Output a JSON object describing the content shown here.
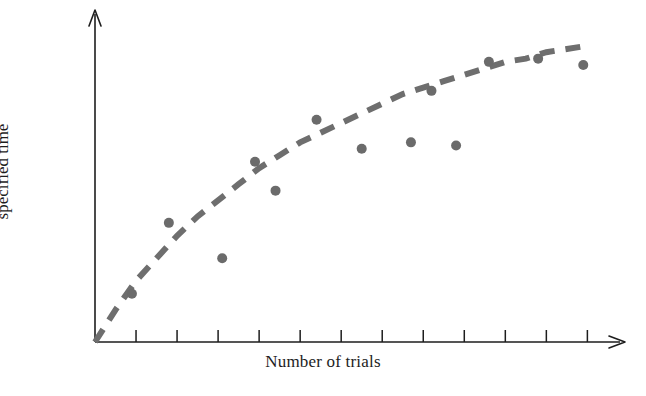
{
  "chart_data": {
    "type": "scatter",
    "title": "",
    "subtitle": "",
    "xlabel": "Number of trials",
    "ylabel": "Percent of responses within specified time",
    "ylabel_lines": [
      "Percent of responses within",
      "specified time"
    ],
    "xlim": [
      0,
      12.6
    ],
    "ylim": [
      0,
      100
    ],
    "grid": false,
    "legend": null,
    "axis_tick_labels": {
      "x": [],
      "y": []
    },
    "x_tick_count": 12,
    "y_tick_count": 0,
    "points": [
      {
        "x": 0.9,
        "y": 15
      },
      {
        "x": 1.8,
        "y": 37
      },
      {
        "x": 3.1,
        "y": 26
      },
      {
        "x": 3.9,
        "y": 56
      },
      {
        "x": 4.4,
        "y": 47
      },
      {
        "x": 5.4,
        "y": 69
      },
      {
        "x": 6.5,
        "y": 60
      },
      {
        "x": 7.7,
        "y": 62
      },
      {
        "x": 8.2,
        "y": 78
      },
      {
        "x": 8.8,
        "y": 61
      },
      {
        "x": 9.6,
        "y": 87
      },
      {
        "x": 10.8,
        "y": 88
      },
      {
        "x": 11.9,
        "y": 86
      }
    ],
    "fit_curve": {
      "style": "dashed",
      "description": "negatively accelerated learning curve rising from origin and flattening",
      "points": [
        {
          "x": 0.0,
          "y": 0
        },
        {
          "x": 0.5,
          "y": 10
        },
        {
          "x": 1.0,
          "y": 19
        },
        {
          "x": 1.5,
          "y": 26
        },
        {
          "x": 2.0,
          "y": 33
        },
        {
          "x": 2.5,
          "y": 39
        },
        {
          "x": 3.0,
          "y": 44
        },
        {
          "x": 3.5,
          "y": 49
        },
        {
          "x": 4.0,
          "y": 54
        },
        {
          "x": 4.5,
          "y": 58
        },
        {
          "x": 5.0,
          "y": 62
        },
        {
          "x": 5.5,
          "y": 65
        },
        {
          "x": 6.0,
          "y": 68
        },
        {
          "x": 6.5,
          "y": 71
        },
        {
          "x": 7.0,
          "y": 74
        },
        {
          "x": 7.5,
          "y": 77
        },
        {
          "x": 8.0,
          "y": 79
        },
        {
          "x": 8.5,
          "y": 81
        },
        {
          "x": 9.0,
          "y": 83
        },
        {
          "x": 9.5,
          "y": 85
        },
        {
          "x": 10.0,
          "y": 87
        },
        {
          "x": 10.5,
          "y": 88
        },
        {
          "x": 11.0,
          "y": 90
        },
        {
          "x": 11.5,
          "y": 91
        },
        {
          "x": 12.0,
          "y": 92
        }
      ]
    },
    "colors": {
      "point": "#6b6b6b",
      "curve": "#6e6e6e",
      "axis": "#1d1d1d",
      "background": "#ffffff",
      "text": "#1d1d1d"
    }
  }
}
